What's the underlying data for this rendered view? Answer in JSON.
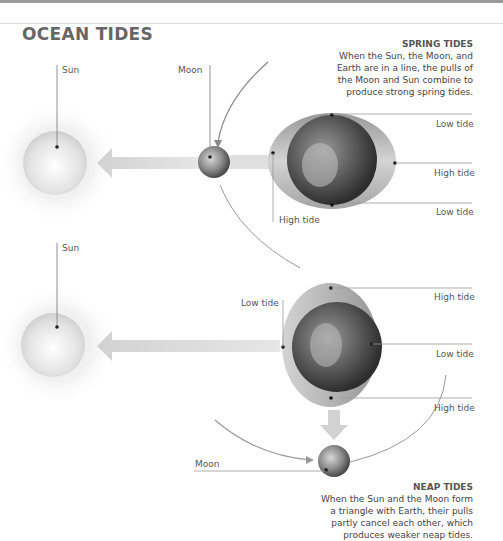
{
  "title": "OCEAN TIDES",
  "spring": {
    "heading": "SPRING TIDES",
    "lines": [
      "When the Sun, the Moon, and",
      "Earth are in a line, the pulls of",
      "the Moon and Sun combine to",
      "produce strong spring tides."
    ],
    "labels": {
      "sun": "Sun",
      "moon": "Moon",
      "low_top": "Low tide",
      "high_right": "High tide",
      "low_bottom": "Low tide",
      "high_left": "High tide"
    }
  },
  "neap": {
    "heading": "NEAP TIDES",
    "lines": [
      "When the Sun and the Moon form",
      "a triangle with Earth, their pulls",
      "partly cancel each other, which",
      "produces weaker neap tides."
    ],
    "labels": {
      "sun": "Sun",
      "moon": "Moon",
      "low_left": "Low tide",
      "high_top": "High tide",
      "low_right": "Low tide",
      "high_bottom": "High tide"
    }
  },
  "colors": {
    "text": "#555555",
    "line": "#999999",
    "arrow": "#d4d4d4",
    "bulge": "#b8b8b8"
  }
}
